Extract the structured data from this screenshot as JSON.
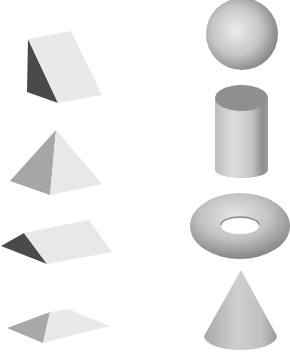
{
  "figure": {
    "description": "Eight shaded 3D geometric solids arranged in two columns",
    "colors": {
      "background": "#ffffff",
      "light_face": "#e8e8e8",
      "mid_face": "#a8a8a8",
      "dark_face": "#4a4a4a",
      "curved_light": "#dcdcdc",
      "curved_mid": "#b4b4b4",
      "curved_dark": "#7a7a7a"
    },
    "left_column": [
      {
        "name": "Triangular wedge (upright)"
      },
      {
        "name": "Square pyramid"
      },
      {
        "name": "Triangular prism (lying)"
      },
      {
        "name": "Flat pyramid"
      }
    ],
    "right_column": [
      {
        "name": "Sphere"
      },
      {
        "name": "Cylinder"
      },
      {
        "name": "Torus"
      },
      {
        "name": "Cone"
      }
    ]
  }
}
